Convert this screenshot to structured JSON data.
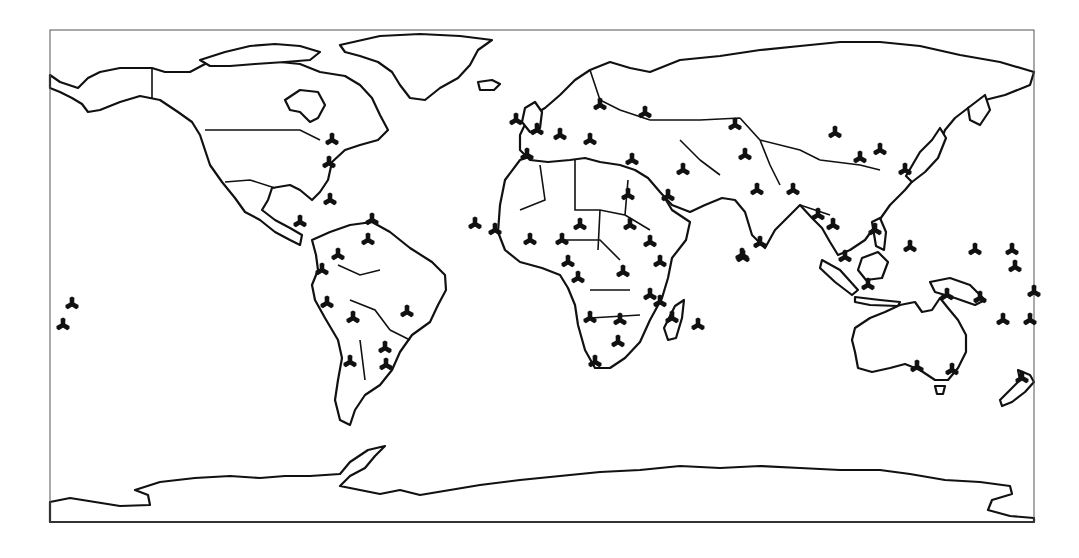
{
  "map": {
    "type": "world-map",
    "projection": "equirectangular",
    "width": 1079,
    "height": 558,
    "frame": {
      "x": 50,
      "y": 30,
      "width": 984,
      "height": 490
    },
    "colors": {
      "land_fill": "#ffffff",
      "outline": "#111111",
      "marker": "#111111",
      "background": "#ffffff"
    },
    "marker_icon": "trefoil-marker-icon",
    "markers": [
      {
        "region": "Hawaii-1",
        "x": 72,
        "y": 304
      },
      {
        "region": "Hawaii-2",
        "x": 63,
        "y": 325
      },
      {
        "region": "US-Northeast",
        "x": 332,
        "y": 140
      },
      {
        "region": "US-East",
        "x": 329,
        "y": 163
      },
      {
        "region": "Cuba",
        "x": 330,
        "y": 200
      },
      {
        "region": "Central-America",
        "x": 300,
        "y": 222
      },
      {
        "region": "Caribbean",
        "x": 372,
        "y": 220
      },
      {
        "region": "Colombia",
        "x": 338,
        "y": 255
      },
      {
        "region": "Venezuela",
        "x": 368,
        "y": 240
      },
      {
        "region": "Ecuador",
        "x": 322,
        "y": 270
      },
      {
        "region": "Peru",
        "x": 327,
        "y": 303
      },
      {
        "region": "Brazil-Central",
        "x": 407,
        "y": 312
      },
      {
        "region": "Bolivia",
        "x": 353,
        "y": 318
      },
      {
        "region": "Paraguay",
        "x": 385,
        "y": 348
      },
      {
        "region": "Argentina",
        "x": 386,
        "y": 365
      },
      {
        "region": "Chile",
        "x": 350,
        "y": 362
      },
      {
        "region": "Cape-Verde",
        "x": 475,
        "y": 224
      },
      {
        "region": "Senegal",
        "x": 495,
        "y": 230
      },
      {
        "region": "Ghana",
        "x": 530,
        "y": 240
      },
      {
        "region": "Nigeria",
        "x": 562,
        "y": 240
      },
      {
        "region": "Cameroon",
        "x": 568,
        "y": 262
      },
      {
        "region": "Chad",
        "x": 580,
        "y": 225
      },
      {
        "region": "Sudan",
        "x": 630,
        "y": 225
      },
      {
        "region": "Ethiopia",
        "x": 650,
        "y": 242
      },
      {
        "region": "Kenya",
        "x": 660,
        "y": 262
      },
      {
        "region": "Congo",
        "x": 578,
        "y": 278
      },
      {
        "region": "DRC",
        "x": 623,
        "y": 272
      },
      {
        "region": "Angola",
        "x": 590,
        "y": 318
      },
      {
        "region": "Tanzania",
        "x": 650,
        "y": 295
      },
      {
        "region": "Mozambique",
        "x": 660,
        "y": 302
      },
      {
        "region": "Zambia",
        "x": 620,
        "y": 320
      },
      {
        "region": "South-Africa",
        "x": 618,
        "y": 342
      },
      {
        "region": "South-Africa-Cape",
        "x": 595,
        "y": 362
      },
      {
        "region": "Madagascar",
        "x": 672,
        "y": 318
      },
      {
        "region": "Mauritius",
        "x": 698,
        "y": 325
      },
      {
        "region": "Iceland",
        "x": 516,
        "y": 120
      },
      {
        "region": "UK",
        "x": 537,
        "y": 130
      },
      {
        "region": "Spain",
        "x": 527,
        "y": 155
      },
      {
        "region": "Western-Europe",
        "x": 560,
        "y": 135
      },
      {
        "region": "Central-Europe",
        "x": 590,
        "y": 140
      },
      {
        "region": "Scandinavia",
        "x": 600,
        "y": 105
      },
      {
        "region": "Russia-West",
        "x": 645,
        "y": 113
      },
      {
        "region": "Turkey",
        "x": 632,
        "y": 160
      },
      {
        "region": "Egypt",
        "x": 628,
        "y": 195
      },
      {
        "region": "Saudi-Arabia",
        "x": 668,
        "y": 196
      },
      {
        "region": "Iran",
        "x": 683,
        "y": 170
      },
      {
        "region": "Kazakhstan",
        "x": 735,
        "y": 125
      },
      {
        "region": "Central-Asia",
        "x": 745,
        "y": 155
      },
      {
        "region": "Pakistan",
        "x": 757,
        "y": 190
      },
      {
        "region": "India-North",
        "x": 793,
        "y": 190
      },
      {
        "region": "India-South",
        "x": 760,
        "y": 243
      },
      {
        "region": "Sri-Lanka",
        "x": 743,
        "y": 257
      },
      {
        "region": "Maldives",
        "x": 742,
        "y": 255
      },
      {
        "region": "Mongolia",
        "x": 835,
        "y": 133
      },
      {
        "region": "China-North",
        "x": 860,
        "y": 158
      },
      {
        "region": "Korea",
        "x": 880,
        "y": 150
      },
      {
        "region": "Japan",
        "x": 905,
        "y": 170
      },
      {
        "region": "Thailand",
        "x": 818,
        "y": 215
      },
      {
        "region": "Vietnam",
        "x": 833,
        "y": 225
      },
      {
        "region": "Philippines",
        "x": 875,
        "y": 230
      },
      {
        "region": "Malaysia",
        "x": 845,
        "y": 257
      },
      {
        "region": "Indonesia",
        "x": 868,
        "y": 285
      },
      {
        "region": "Micronesia",
        "x": 910,
        "y": 247
      },
      {
        "region": "Marshall-Islands",
        "x": 975,
        "y": 250
      },
      {
        "region": "Kiribati",
        "x": 1012,
        "y": 250
      },
      {
        "region": "Tuvalu",
        "x": 1015,
        "y": 267
      },
      {
        "region": "PNG",
        "x": 947,
        "y": 295
      },
      {
        "region": "Solomon-Islands",
        "x": 980,
        "y": 298
      },
      {
        "region": "Vanuatu",
        "x": 1003,
        "y": 320
      },
      {
        "region": "Fiji",
        "x": 1030,
        "y": 320
      },
      {
        "region": "Samoa",
        "x": 1034,
        "y": 292
      },
      {
        "region": "Australia-West",
        "x": 917,
        "y": 367
      },
      {
        "region": "Australia-Southeast",
        "x": 952,
        "y": 370
      },
      {
        "region": "New-Zealand",
        "x": 1022,
        "y": 378
      }
    ]
  }
}
